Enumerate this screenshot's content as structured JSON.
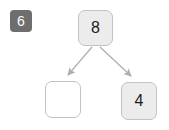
{
  "diagram": {
    "type": "binary-tree-fragment",
    "title_badge": {
      "label": "6",
      "color": "#6e6e6e",
      "text_color": "#ffffff"
    },
    "background_color": "#ffffff",
    "edge_color": "#b0b0b0",
    "nodes": [
      {
        "id": "node-top",
        "value": "8",
        "filled": true,
        "fill_color": "#ececec",
        "border_color": "#c2c2c2"
      },
      {
        "id": "node-left",
        "value": "",
        "filled": false,
        "fill_color": "#ffffff",
        "border_color": "#c2c2c2"
      },
      {
        "id": "node-right",
        "value": "4",
        "filled": true,
        "fill_color": "#ececec",
        "border_color": "#c2c2c2"
      }
    ],
    "edges": [
      {
        "from": "node-top",
        "to": "node-left",
        "arrow": true
      },
      {
        "from": "node-top",
        "to": "node-right",
        "arrow": true
      }
    ]
  }
}
